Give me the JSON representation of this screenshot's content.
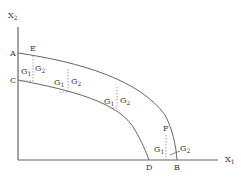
{
  "diagram": {
    "type": "production possibility frontiers",
    "axes": {
      "y": {
        "label": "X",
        "sub": "2"
      },
      "x": {
        "label": "X",
        "sub": "1"
      }
    },
    "points": {
      "A": "A",
      "C": "C",
      "E": "E",
      "F": "F",
      "D": "D",
      "B": "B"
    },
    "gap_labels": [
      {
        "g1": "G",
        "g1sub": "1",
        "g2": "G",
        "g2sub": "2"
      },
      {
        "g1": "G",
        "g1sub": "1",
        "g2": "G",
        "g2sub": "2"
      },
      {
        "g1": "G",
        "g1sub": "1",
        "g2": "G",
        "g2sub": "2"
      },
      {
        "g1": "G",
        "g1sub": "1",
        "g2": "G",
        "g2sub": "2"
      }
    ],
    "colors": {
      "line": "#666666",
      "text": "#333333"
    }
  }
}
